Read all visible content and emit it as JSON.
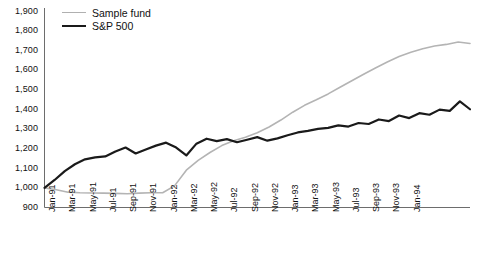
{
  "chart_data": {
    "type": "line",
    "title": "",
    "subtitle": "",
    "xlabel": "",
    "ylabel": "",
    "ylim": [
      900,
      1900
    ],
    "ytick_labels": [
      "1,900",
      "1,800",
      "1,700",
      "1,600",
      "1,500",
      "1,400",
      "1,300",
      "1,200",
      "1,100",
      "1,000",
      "900"
    ],
    "yticks": [
      1900,
      1800,
      1700,
      1600,
      1500,
      1400,
      1300,
      1200,
      1100,
      1000,
      900
    ],
    "grid": false,
    "legend_position": "top-left",
    "x": [
      "Jan-91",
      "Feb-91",
      "Mar-91",
      "Apr-91",
      "May-91",
      "Jun-91",
      "Jul-91",
      "Aug-91",
      "Sep-91",
      "Oct-91",
      "Nov-91",
      "Dec-91",
      "Jan-92",
      "Feb-92",
      "Mar-92",
      "Apr-92",
      "May-92",
      "Jun-92",
      "Jul-92",
      "Aug-92",
      "Sep-92",
      "Oct-92",
      "Nov-92",
      "Dec-92",
      "Jan-93",
      "Feb-93",
      "Mar-93",
      "Apr-93",
      "May-93",
      "Jun-93",
      "Jul-93",
      "Aug-93",
      "Sep-93",
      "Oct-93",
      "Nov-93",
      "Dec-93",
      "Jan-94"
    ],
    "xtick_labels": [
      "Jan-91",
      "Mar-91",
      "May-91",
      "Jul-91",
      "Sep-91",
      "Nov-91",
      "Jan-92",
      "Mar-92",
      "May-92",
      "Jul-92",
      "Sep-92",
      "Nov-92",
      "Jan-93",
      "Mar-93",
      "May-93",
      "Jul-93",
      "Sep-93",
      "Nov-93",
      "Jan-94"
    ],
    "series": [
      {
        "name": "Sample fund",
        "color": "#b4b4b4",
        "width": 1.6,
        "values": [
          1000,
          990,
          978,
          975,
          974,
          973,
          972,
          970,
          973,
          975,
          975,
          1010,
          1090,
          1140,
          1180,
          1215,
          1240,
          1258,
          1280,
          1310,
          1345,
          1385,
          1420,
          1448,
          1478,
          1512,
          1545,
          1578,
          1610,
          1640,
          1668,
          1690,
          1708,
          1722,
          1730,
          1742,
          1735
        ]
      },
      {
        "name": "S&P 500",
        "color": "#1a1a1a",
        "width": 2.2,
        "values": [
          1000,
          1040,
          1085,
          1120,
          1145,
          1155,
          1160,
          1185,
          1205,
          1175,
          1195,
          1215,
          1230,
          1205,
          1165,
          1225,
          1250,
          1238,
          1248,
          1232,
          1245,
          1258,
          1240,
          1252,
          1268,
          1282,
          1290,
          1300,
          1305,
          1318,
          1312,
          1330,
          1325,
          1348,
          1340,
          1368,
          1355
        ]
      }
    ],
    "series_tail": [
      {
        "name": "S&P 500",
        "values": [
          1380,
          1372,
          1398,
          1392,
          1440,
          1400
        ]
      }
    ]
  },
  "legend": {
    "items": [
      {
        "label": "Sample fund"
      },
      {
        "label": "S&P 500"
      }
    ]
  }
}
